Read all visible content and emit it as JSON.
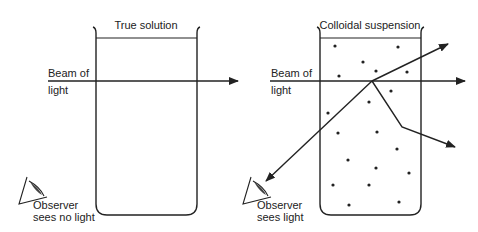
{
  "panels": [
    {
      "id": "true-solution",
      "title": "True solution",
      "beam_label_line1": "Beam of",
      "beam_label_line2": "light",
      "observer_line1": "Observer",
      "observer_line2": "sees no light",
      "particles": false
    },
    {
      "id": "colloidal-suspension",
      "title": "Colloidal suspension",
      "beam_label_line1": "Beam of",
      "beam_label_line2": "light",
      "observer_line1": "Observer",
      "observer_line2": "sees light",
      "particles": true
    }
  ],
  "colors": {
    "ink": "#222222",
    "background": "#ffffff"
  }
}
